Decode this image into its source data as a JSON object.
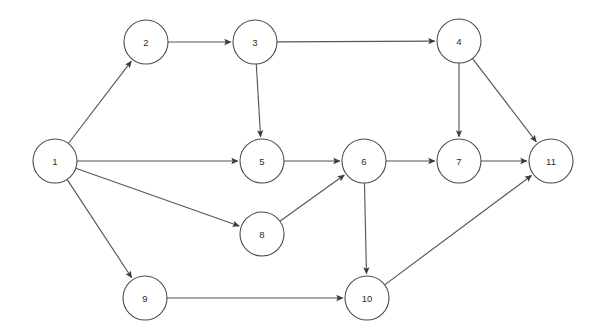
{
  "diagram": {
    "background_color": "#ffffff",
    "node_stroke_color": "#4a4a52",
    "node_fill_color": "#ffffff",
    "node_label_color": "#2b2b31",
    "edge_color": "#55555d",
    "node_radius": 22,
    "nodes": [
      {
        "id": "1",
        "label": "1",
        "cx": 55,
        "cy": 161
      },
      {
        "id": "2",
        "label": "2",
        "cx": 146,
        "cy": 42
      },
      {
        "id": "3",
        "label": "3",
        "cx": 255,
        "cy": 42
      },
      {
        "id": "4",
        "label": "4",
        "cx": 459,
        "cy": 41
      },
      {
        "id": "5",
        "label": "5",
        "cx": 262,
        "cy": 161
      },
      {
        "id": "6",
        "label": "6",
        "cx": 364,
        "cy": 161
      },
      {
        "id": "7",
        "label": "7",
        "cx": 459,
        "cy": 161
      },
      {
        "id": "8",
        "label": "8",
        "cx": 262,
        "cy": 234
      },
      {
        "id": "9",
        "label": "9",
        "cx": 145,
        "cy": 298
      },
      {
        "id": "10",
        "label": "10",
        "cx": 367,
        "cy": 298
      },
      {
        "id": "11",
        "label": "11",
        "cx": 551,
        "cy": 161
      }
    ],
    "edges": [
      {
        "from": "1",
        "to": "2",
        "directed": true
      },
      {
        "from": "1",
        "to": "5",
        "directed": true
      },
      {
        "from": "1",
        "to": "8",
        "directed": true
      },
      {
        "from": "1",
        "to": "9",
        "directed": true
      },
      {
        "from": "2",
        "to": "3",
        "directed": true
      },
      {
        "from": "3",
        "to": "4",
        "directed": true
      },
      {
        "from": "3",
        "to": "5",
        "directed": true
      },
      {
        "from": "4",
        "to": "7",
        "directed": true
      },
      {
        "from": "4",
        "to": "11",
        "directed": true
      },
      {
        "from": "5",
        "to": "6",
        "directed": true
      },
      {
        "from": "6",
        "to": "7",
        "directed": true
      },
      {
        "from": "6",
        "to": "10",
        "directed": true
      },
      {
        "from": "7",
        "to": "11",
        "directed": true
      },
      {
        "from": "8",
        "to": "6",
        "directed": true
      },
      {
        "from": "9",
        "to": "10",
        "directed": true
      },
      {
        "from": "10",
        "to": "11",
        "directed": true
      }
    ]
  }
}
